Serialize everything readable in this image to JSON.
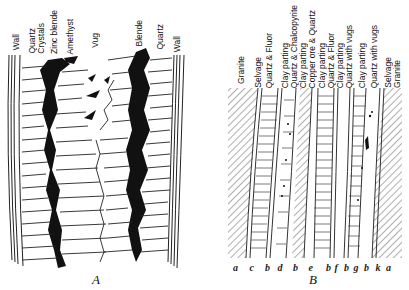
{
  "figure_a": {
    "caption": "A",
    "labels": [
      {
        "text": "Wall",
        "x": 12
      },
      {
        "text": "Quartz",
        "x": 28
      },
      {
        "text": "Crystals",
        "x": 37
      },
      {
        "text": "Zinc blende",
        "x": 50
      },
      {
        "text": "Amethyst",
        "x": 66
      },
      {
        "text": "Vug",
        "x": 91
      },
      {
        "text": "Blende",
        "x": 135
      },
      {
        "text": "Quartz",
        "x": 156
      },
      {
        "text": "Wall",
        "x": 173
      }
    ]
  },
  "figure_b": {
    "caption": "B",
    "labels": [
      {
        "text": "Granite",
        "x": 237
      },
      {
        "text": "Selvage",
        "x": 254
      },
      {
        "text": "Quartz & Fluor",
        "x": 266
      },
      {
        "text": "Clay parting",
        "x": 282
      },
      {
        "text": "Quartz & Chalcopyrite",
        "x": 291
      },
      {
        "text": "Clay parting",
        "x": 300
      },
      {
        "text": "Copper ore & Quartz",
        "x": 309
      },
      {
        "text": "Clay parting",
        "x": 319
      },
      {
        "text": "Quartz & Fluor",
        "x": 328
      },
      {
        "text": "Clay parting",
        "x": 337
      },
      {
        "text": "Quartz with vugs",
        "x": 346
      },
      {
        "text": "Clay parting",
        "x": 359
      },
      {
        "text": "Quartz with vugs",
        "x": 371
      },
      {
        "text": "Selvage",
        "x": 385
      },
      {
        "text": "Granite",
        "x": 394
      }
    ],
    "letters": [
      "a",
      "c",
      "b",
      "d",
      "b",
      "e",
      "b",
      "f",
      "b",
      "g",
      "b",
      "k",
      "a"
    ]
  }
}
